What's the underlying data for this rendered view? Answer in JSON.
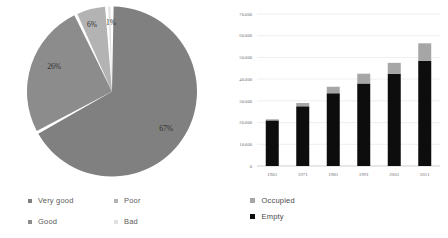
{
  "chart_data": [
    {
      "type": "pie",
      "title": "",
      "categories": [
        "Very good",
        "Good",
        "Poor",
        "Bad"
      ],
      "values": [
        67,
        26,
        6,
        1
      ],
      "data_labels": [
        "67%",
        "26%",
        "6%",
        "1%"
      ],
      "units": "percent",
      "colors": [
        "#808080",
        "#8c8c8c",
        "#b3b3b3",
        "#e0e0e0"
      ],
      "legend": {
        "position": "bottom",
        "columns": 2,
        "entries": [
          {
            "label": "Very good",
            "color": "#808080"
          },
          {
            "label": "Good",
            "color": "#8c8c8c"
          },
          {
            "label": "Poor",
            "color": "#b3b3b3"
          },
          {
            "label": "Bad",
            "color": "#e0e0e0"
          }
        ]
      },
      "start_angle_deg": 0,
      "direction": "clockwise",
      "slice_gap": true
    },
    {
      "type": "bar",
      "subtype": "stacked",
      "title": "",
      "xlabel": "",
      "ylabel": "",
      "categories": [
        "1961",
        "1971",
        "1981",
        "1991",
        "2001",
        "2011"
      ],
      "ylim": [
        0,
        70000
      ],
      "ytick_values": [
        0,
        10000,
        20000,
        30000,
        40000,
        50000,
        60000,
        70000
      ],
      "ytick_labels": [
        "0",
        "10.000",
        "20.000",
        "30.000",
        "40.000",
        "50.000",
        "60.000",
        "70.000"
      ],
      "grid": true,
      "series": [
        {
          "name": "Empty",
          "color": "#0d0d0d",
          "values": [
            21000,
            27500,
            33500,
            38000,
            42500,
            48500
          ]
        },
        {
          "name": "Occupied",
          "color": "#a6a6a6",
          "values": [
            500,
            1500,
            3000,
            4500,
            5000,
            8000
          ]
        }
      ],
      "stack_order": [
        "Empty",
        "Occupied"
      ],
      "legend": {
        "position": "bottom-left",
        "entries": [
          {
            "label": "Occupied",
            "color": "#a6a6a6"
          },
          {
            "label": "Empty",
            "color": "#0d0d0d"
          }
        ]
      }
    }
  ]
}
